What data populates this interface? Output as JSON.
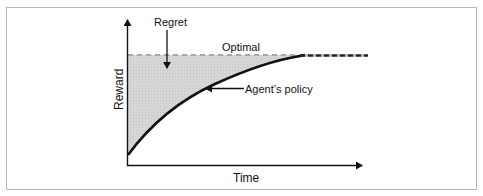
{
  "diagram": {
    "labels": {
      "regret": "Regret",
      "optimal": "Optimal",
      "agents_policy": "Agent’s policy",
      "y_axis": "Reward",
      "x_axis": "Time"
    },
    "colors": {
      "frame": "#b8b8b8",
      "regret_fill": "#d4d4d4",
      "optimal_dash": "#a8a8a8",
      "curve": "#111111",
      "axis": "#111111",
      "text": "#111111"
    }
  }
}
